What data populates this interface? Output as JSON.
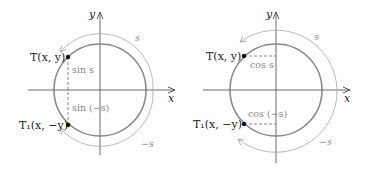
{
  "colors": {
    "axis": "#444444",
    "circle": "#8a8a8a",
    "arc": "#a8a8a8",
    "dashed": "#555555",
    "point": "#111111",
    "label": "#222222",
    "trig_label": "#888888"
  },
  "left": {
    "axis_x": "x",
    "axis_y": "y",
    "point_T": "T(x, y)",
    "point_T1": "T₁(x, −y)",
    "seg_upper": "sin s",
    "seg_lower": "sin (−s)",
    "arc_upper": "s",
    "arc_lower": "−s"
  },
  "right": {
    "axis_x": "x",
    "axis_y": "y",
    "point_T": "T(x, y)",
    "point_T1": "T₁(x, −y)",
    "seg_upper": "cos s",
    "seg_lower": "cos (−s)",
    "arc_upper": "s",
    "arc_lower": "−s"
  }
}
